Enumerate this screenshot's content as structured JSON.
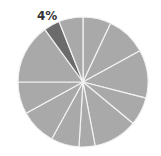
{
  "chart_data": {
    "type": "pie",
    "title": "",
    "center": [
      83,
      82
    ],
    "radius": 65,
    "start_angle_deg": 0,
    "direction": "clockwise",
    "slice_color": "#a9a9a9",
    "highlight_color": "#6b6b6b",
    "separator_color": "#f2f2f2",
    "slices": [
      {
        "value": 7,
        "highlight": false,
        "label": ""
      },
      {
        "value": 10,
        "highlight": false,
        "label": ""
      },
      {
        "value": 12,
        "highlight": false,
        "label": ""
      },
      {
        "value": 7,
        "highlight": false,
        "label": ""
      },
      {
        "value": 11,
        "highlight": false,
        "label": ""
      },
      {
        "value": 4,
        "highlight": false,
        "label": ""
      },
      {
        "value": 7,
        "highlight": false,
        "label": ""
      },
      {
        "value": 9,
        "highlight": false,
        "label": ""
      },
      {
        "value": 8,
        "highlight": false,
        "label": ""
      },
      {
        "value": 15,
        "highlight": false,
        "label": ""
      },
      {
        "value": 4,
        "highlight": true,
        "label": "4%"
      },
      {
        "value": 6,
        "highlight": false,
        "label": ""
      }
    ],
    "annotations": [
      {
        "text": "4%",
        "x": 37,
        "y": 10
      }
    ],
    "legend": null
  }
}
